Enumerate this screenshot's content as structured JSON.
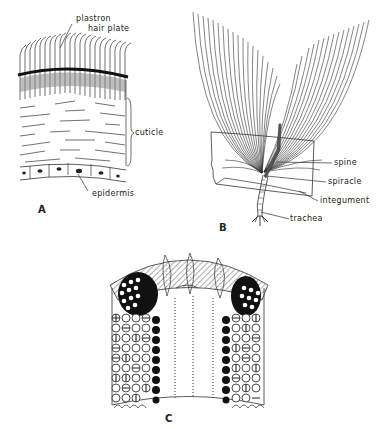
{
  "figure": {
    "panels": [
      {
        "id": "A",
        "letter": "A",
        "labels": {
          "plastron": "plastron",
          "hair_plate": "hair plate",
          "cuticle": "cuticle",
          "epidermis": "epidermis"
        }
      },
      {
        "id": "B",
        "letter": "B",
        "labels": {
          "spine": "spine",
          "spiracle": "spiracle",
          "integument": "integument",
          "trachea": "trachea"
        }
      },
      {
        "id": "C",
        "letter": "C",
        "labels": {}
      }
    ]
  }
}
